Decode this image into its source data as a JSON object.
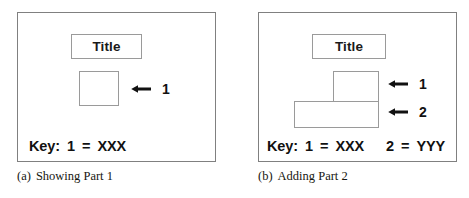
{
  "figure": {
    "background_color": "#ffffff",
    "frame_color": "#808080",
    "box_border_color": "#9a9a9a",
    "text_color": "#111111"
  },
  "panels": [
    {
      "id": "a",
      "caption_tag": "(a)",
      "caption_text": "Showing Part 1",
      "title_label": "Title",
      "parts": [
        {
          "number": "1",
          "arrow": "left-arrow-icon"
        }
      ],
      "key": {
        "label": "Key:",
        "entries": [
          {
            "number": "1",
            "equals": "=",
            "value": "XXX"
          }
        ]
      }
    },
    {
      "id": "b",
      "caption_tag": "(b)",
      "caption_text": "Adding Part 2",
      "title_label": "Title",
      "parts": [
        {
          "number": "1",
          "arrow": "left-arrow-icon"
        },
        {
          "number": "2",
          "arrow": "left-arrow-icon"
        }
      ],
      "key": {
        "label": "Key:",
        "entries": [
          {
            "number": "1",
            "equals": "=",
            "value": "XXX"
          },
          {
            "number": "2",
            "equals": "=",
            "value": "YYY"
          }
        ]
      }
    }
  ]
}
